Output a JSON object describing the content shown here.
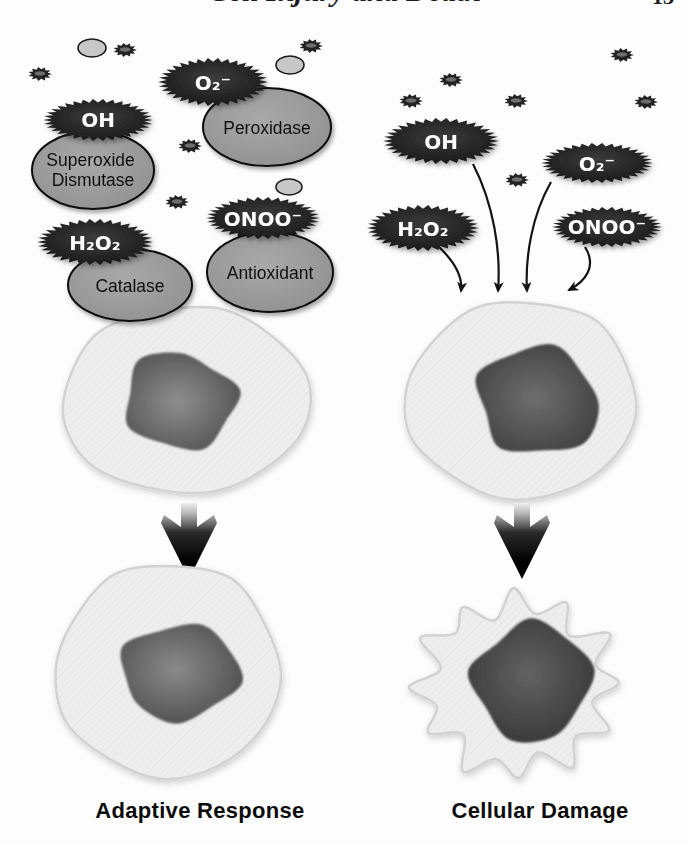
{
  "page": {
    "running_header": "Cell Injury and Death",
    "page_number": "13"
  },
  "left": {
    "caption": "Adaptive Response",
    "ros": {
      "oh": "OH",
      "o2": "O₂⁻",
      "h2o2": "H₂O₂",
      "onoo": "ONOO⁻"
    },
    "enzymes": {
      "sod": {
        "line1": "Superoxide",
        "line2": "Dismutase"
      },
      "peroxidase": "Peroxidase",
      "catalase": "Catalase",
      "antioxidant": "Antioxidant"
    }
  },
  "right": {
    "caption": "Cellular Damage",
    "ros": {
      "oh": "OH",
      "o2": "O₂⁻",
      "h2o2": "H₂O₂",
      "onoo": "ONOO⁻"
    }
  },
  "particles": {
    "dark_radical_count": 11,
    "light_vesicle_count": 3
  },
  "colors": {
    "ros_blob_fill": "#1b1b1b",
    "ros_text": "#ffffff",
    "enzyme_fill": "#989898",
    "enzyme_outline": "#0e0e0e",
    "cell_fill": "#ededed",
    "nucleus_dark": "#3d3d3d",
    "background": "#fdfdfd"
  }
}
